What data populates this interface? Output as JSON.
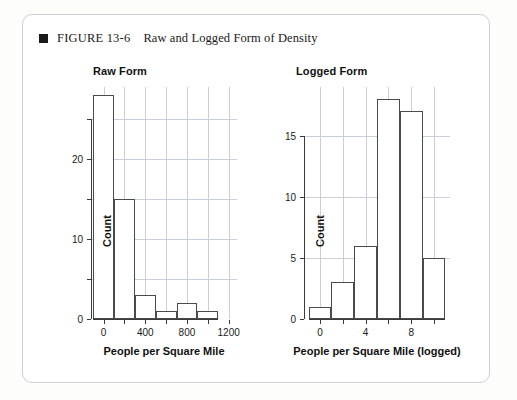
{
  "figure": {
    "bullet_icon": "filled-square-icon",
    "label": "FIGURE 13-6",
    "title": "Raw and Logged Form of Density"
  },
  "chart_data": [
    {
      "type": "bar",
      "title": "Raw Form",
      "xlabel": "People per Square Mile",
      "ylabel": "Count",
      "xlim": [
        -120,
        1280
      ],
      "ylim": [
        0,
        29
      ],
      "grid": true,
      "legend": "none",
      "bin_width": 200,
      "bin_edges": [
        -100,
        100,
        300,
        500,
        700,
        900,
        1100
      ],
      "bin_centers": [
        0,
        200,
        400,
        600,
        800,
        1000
      ],
      "values": [
        28,
        15,
        3,
        1,
        2,
        1
      ],
      "xticks": [
        0,
        200,
        400,
        600,
        800,
        1000,
        1200
      ],
      "xtick_labels": [
        "0",
        "",
        "400",
        "",
        "800",
        "",
        "1200"
      ],
      "yticks": [
        0,
        5,
        10,
        15,
        20,
        25
      ],
      "ytick_labels": [
        "0",
        "",
        "10",
        "",
        "20",
        ""
      ]
    },
    {
      "type": "bar",
      "title": "Logged Form",
      "xlabel": "People per Square Mile (logged)",
      "ylabel": "Count",
      "xlim": [
        -1.4,
        11.4
      ],
      "ylim": [
        0,
        19
      ],
      "grid": true,
      "legend": "none",
      "bin_width": 2,
      "bin_edges": [
        -1,
        1,
        3,
        5,
        7,
        9,
        11
      ],
      "bin_centers": [
        0,
        2,
        4,
        6,
        8,
        10
      ],
      "values": [
        1,
        3,
        6,
        18,
        17,
        5
      ],
      "xticks": [
        0,
        2,
        4,
        6,
        8,
        10
      ],
      "xtick_labels": [
        "0",
        "",
        "4",
        "",
        "8",
        ""
      ],
      "yticks": [
        0,
        5,
        10,
        15
      ],
      "ytick_labels": [
        "0",
        "5",
        "10",
        "15"
      ]
    }
  ]
}
